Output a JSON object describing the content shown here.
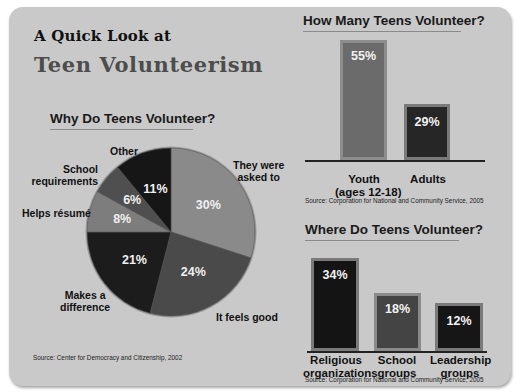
{
  "header": {
    "line1": "A Quick Look at",
    "line2": "Teen Volunteerism"
  },
  "pie_section": {
    "title": "Why Do Teens Volunteer?",
    "source": "Source: Center for Democracy and Citizenship, 2002",
    "slices": [
      {
        "label": "They were asked to",
        "label_lines": [
          "They were",
          "asked to"
        ],
        "value": 30,
        "display": "30%",
        "color": "#8a8a8a"
      },
      {
        "label": "It feels good",
        "label_lines": [
          "It feels good"
        ],
        "value": 24,
        "display": "24%",
        "color": "#4a4a4a"
      },
      {
        "label": "Makes a difference",
        "label_lines": [
          "Makes a",
          "difference"
        ],
        "value": 21,
        "display": "21%",
        "color": "#1c1c1c"
      },
      {
        "label": "Helps résumé",
        "label_lines": [
          "Helps résumé"
        ],
        "value": 8,
        "display": "8%",
        "color": "#7d7d7d"
      },
      {
        "label": "School requirements",
        "label_lines": [
          "School",
          "requirements"
        ],
        "value": 6,
        "display": "6%",
        "color": "#4f4f4f"
      },
      {
        "label": "Other",
        "label_lines": [
          "Other"
        ],
        "value": 11,
        "display": "11%",
        "color": "#161616"
      }
    ]
  },
  "how_many_section": {
    "title": "How Many Teens Volunteer?",
    "source": "Source: Corporation for National and Community Service, 2005",
    "bars": [
      {
        "label_lines": [
          "Youth",
          "(ages 12-18)"
        ],
        "value": 55,
        "display": "55%",
        "color": "#6b6b6b"
      },
      {
        "label_lines": [
          "Adults"
        ],
        "value": 29,
        "display": "29%",
        "color": "#262626"
      }
    ]
  },
  "where_section": {
    "title": "Where Do Teens Volunteer?",
    "source": "Source: Corporation for National and Community Service, 2005",
    "bars": [
      {
        "label_lines": [
          "Religious",
          "organizations"
        ],
        "value": 34,
        "display": "34%",
        "color": "#141414"
      },
      {
        "label_lines": [
          "School",
          "groups"
        ],
        "value": 18,
        "display": "18%",
        "color": "#444444"
      },
      {
        "label_lines": [
          "Leadership",
          "groups"
        ],
        "value": 12,
        "display": "12%",
        "color": "#161616"
      }
    ]
  },
  "chart_data": [
    {
      "type": "pie",
      "title": "Why Do Teens Volunteer?",
      "categories": [
        "They were asked to",
        "It feels good",
        "Makes a difference",
        "Helps résumé",
        "School requirements",
        "Other"
      ],
      "values": [
        30,
        24,
        21,
        8,
        6,
        11
      ],
      "unit": "%",
      "source": "Source: Center for Democracy and Citizenship, 2002"
    },
    {
      "type": "bar",
      "title": "How Many Teens Volunteer?",
      "categories": [
        "Youth (ages 12-18)",
        "Adults"
      ],
      "values": [
        55,
        29
      ],
      "unit": "%",
      "grid": false,
      "source": "Source: Corporation for National and Community Service, 2005"
    },
    {
      "type": "bar",
      "title": "Where Do Teens Volunteer?",
      "categories": [
        "Religious organizations",
        "School groups",
        "Leadership groups"
      ],
      "values": [
        34,
        18,
        12
      ],
      "unit": "%",
      "grid": false,
      "source": "Source: Corporation for National and Community Service, 2005"
    }
  ]
}
